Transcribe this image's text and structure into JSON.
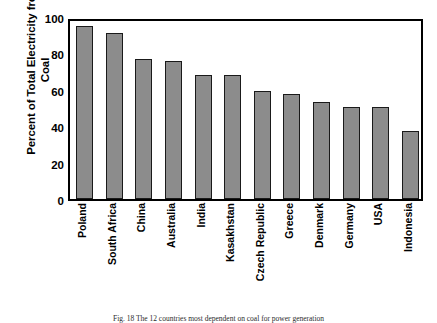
{
  "chart_data": {
    "type": "bar",
    "title": "",
    "xlabel": "",
    "ylabel": "Percent of Total Electricity from Coal",
    "ylim": [
      0,
      100
    ],
    "yticks": [
      0,
      20,
      40,
      60,
      80,
      100
    ],
    "ytick_labels": [
      "0",
      "20",
      "40",
      "60",
      "80",
      "100"
    ],
    "grid": false,
    "legend": null,
    "bar_color": "#8c8c8c",
    "bar_edge_color": "#1a1a1a",
    "categories": [
      "Poland",
      "South Africa",
      "China",
      "Australia",
      "India",
      "Kasakhstan",
      "Czech Republic",
      "Greece",
      "Denmark",
      "Germany",
      "USA",
      "Indonesia"
    ],
    "values": [
      95,
      91,
      77,
      76,
      68,
      68,
      59.5,
      57.5,
      53.5,
      50.5,
      50.5,
      37.5
    ]
  },
  "axes": {
    "y_title": "Percent of Total Electricity from Coal",
    "y_title_line1": "Percent of Total Electricity",
    "y_title_line2": "from Coal"
  },
  "caption": {
    "text": "Fig. 18 The 12 countries most dependent on coal for power generation"
  }
}
